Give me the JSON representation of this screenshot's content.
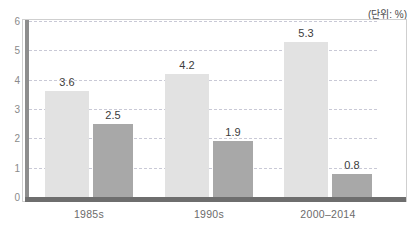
{
  "chart_data": {
    "type": "bar",
    "title": "",
    "subtitle": "",
    "unit_note": "(단위: %)",
    "xlabel": "",
    "ylabel": "",
    "ylim": [
      0,
      6
    ],
    "yticks": [
      "0",
      "1",
      "2",
      "3",
      "4",
      "5",
      "6"
    ],
    "grid": true,
    "legend": "none",
    "categories": [
      "1985s",
      "1990s",
      "2000–2014"
    ],
    "series": [
      {
        "name": "series-light",
        "color": "#e2e2e2",
        "values": [
          3.6,
          4.2,
          5.3
        ],
        "labels": [
          "3.6",
          "4.2",
          "5.3"
        ]
      },
      {
        "name": "series-dark",
        "color": "#a8a8a8",
        "values": [
          2.5,
          1.9,
          0.8
        ],
        "labels": [
          "2.5",
          "1.9",
          "0.8"
        ]
      }
    ]
  }
}
